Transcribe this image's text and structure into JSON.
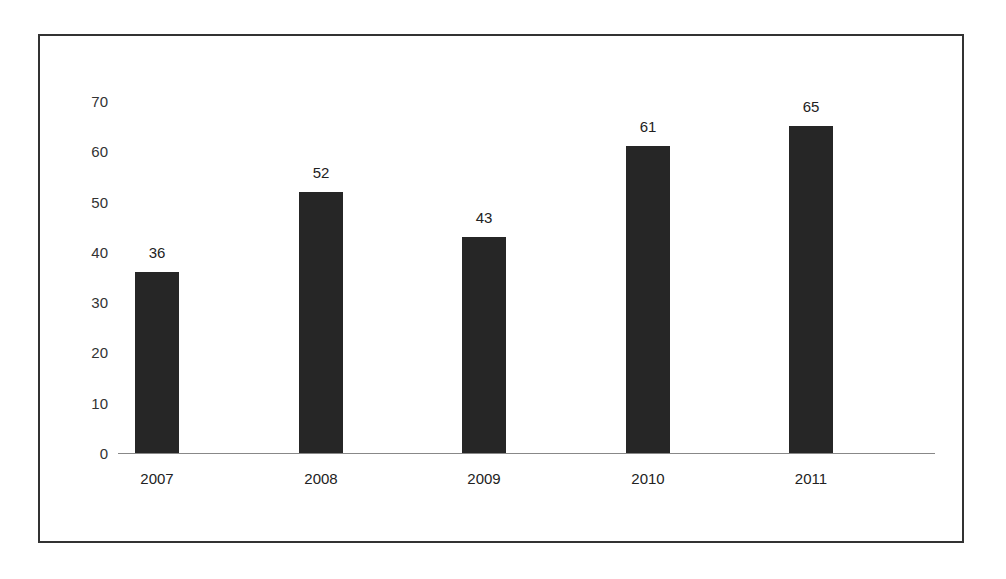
{
  "chart_data": {
    "type": "bar",
    "title": "",
    "xlabel": "",
    "ylabel": "",
    "categories": [
      "2007",
      "2008",
      "2009",
      "2010",
      "2011"
    ],
    "values": [
      36,
      52,
      43,
      61,
      65
    ],
    "data_labels": [
      "36",
      "52",
      "43",
      "61",
      "65"
    ],
    "yticks": [
      "0",
      "10",
      "20",
      "30",
      "40",
      "50",
      "60",
      "70"
    ],
    "ylim": [
      0,
      70
    ],
    "grid": false,
    "legend": null,
    "bar_color": "#262626"
  }
}
